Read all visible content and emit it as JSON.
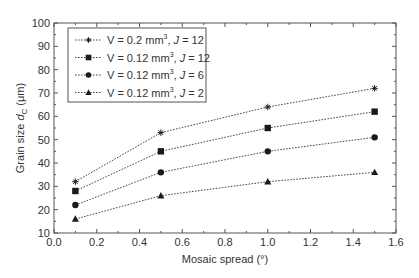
{
  "chart_data": {
    "type": "line",
    "title": "",
    "xlabel": "Mosaic spread (°)",
    "ylabel_main": "Grain size ",
    "ylabel_var": "d",
    "ylabel_sub": "C",
    "ylabel_unit": " (μm)",
    "xlim": [
      0.0,
      1.6
    ],
    "ylim": [
      10,
      100
    ],
    "xticks": [
      0.0,
      0.2,
      0.4,
      0.6,
      0.8,
      1.0,
      1.2,
      1.4,
      1.6
    ],
    "xtick_labels": [
      "0.0",
      "0.2",
      "0.4",
      "0.6",
      "0.8",
      "1.0",
      "1.2",
      "1.4",
      "1.6"
    ],
    "yticks": [
      10,
      20,
      30,
      40,
      50,
      60,
      70,
      80,
      90,
      100
    ],
    "ytick_labels": [
      "10",
      "20",
      "30",
      "40",
      "50",
      "60",
      "70",
      "80",
      "90",
      "100"
    ],
    "grid": false,
    "legend_position": "upper left",
    "x": [
      0.1,
      0.5,
      1.0,
      1.5
    ],
    "series": [
      {
        "name": "V = 0.2 mm³, J = 12",
        "vol": "V = 0.2 mm",
        "j": "J",
        "jval": "= 12",
        "marker": "star",
        "values": [
          32,
          53,
          64,
          72
        ]
      },
      {
        "name": "V = 0.12 mm³, J = 12",
        "vol": "V = 0.12 mm",
        "j": "J",
        "jval": "= 12",
        "marker": "square",
        "values": [
          28,
          45,
          55,
          62
        ]
      },
      {
        "name": "V = 0.12 mm³, J = 6",
        "vol": "V = 0.12 mm",
        "j": "J",
        "jval": "= 6",
        "marker": "circle",
        "values": [
          22,
          36,
          45,
          51
        ]
      },
      {
        "name": "V = 0.12 mm³, J = 2",
        "vol": "V = 0.12 mm",
        "j": "J",
        "jval": "= 2",
        "marker": "triangle",
        "values": [
          16,
          26,
          32,
          36
        ]
      }
    ],
    "colors": {
      "line": "#333333",
      "axis": "#555555",
      "marker": "#1a1a1a"
    }
  }
}
